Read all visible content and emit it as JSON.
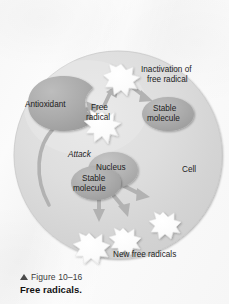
{
  "figure": {
    "caption_number": "Figure 10–16",
    "caption_title": "Free radicals.",
    "caption_marker_icon": "up-triangle-icon"
  },
  "diagram": {
    "type": "biological-process-illustration",
    "colors": {
      "cell_fill": "#d9d9d9",
      "cell_fill_light": "#e8e8e8",
      "organelle_fill": "#a8a8a8",
      "nucleus_fill": "#b4b4b4",
      "radical_fill": "#fdfdfd",
      "arrow_fill": "#b0b0b0",
      "text": "#1c1c1c",
      "background": "#f7f7f7"
    },
    "labels": {
      "cell": "Cell",
      "antioxidant": "Antioxidant",
      "free_radical_line1": "Free",
      "free_radical_line2": "radical",
      "inactivation_line1": "Inactivation of",
      "inactivation_line2": "free radical",
      "stable_molecule_top_line1": "Stable",
      "stable_molecule_top_line2": "molecule",
      "attack": "Attack",
      "nucleus": "Nucleus",
      "stable_molecule_center_line1": "Stable",
      "stable_molecule_center_line2": "molecule",
      "new_free_radicals": "New free radicals"
    },
    "elements": [
      {
        "name": "cell-body",
        "kind": "circle",
        "label": "Cell"
      },
      {
        "name": "antioxidant-blob",
        "kind": "receptor",
        "label": "Antioxidant"
      },
      {
        "name": "free-radical-burst",
        "kind": "starburst",
        "label": "Free radical"
      },
      {
        "name": "inactivated-radical-burst",
        "kind": "starburst",
        "label": "Inactivation of free radical"
      },
      {
        "name": "stable-molecule-top",
        "kind": "ellipse",
        "label": "Stable molecule"
      },
      {
        "name": "nucleus",
        "kind": "ellipse",
        "label": "Nucleus"
      },
      {
        "name": "stable-molecule-center",
        "kind": "ellipse",
        "label": "Stable molecule"
      },
      {
        "name": "new-radical-burst-left",
        "kind": "starburst",
        "label": "New free radicals"
      },
      {
        "name": "new-radical-burst-mid",
        "kind": "starburst",
        "label": "New free radicals"
      },
      {
        "name": "new-radical-burst-right",
        "kind": "starburst",
        "label": "New free radicals"
      }
    ],
    "arrows": [
      {
        "name": "arrow-radical-to-inactivation",
        "from": "free-radical-burst",
        "to": "inactivated-radical-burst"
      },
      {
        "name": "arrow-inactivation-to-stable",
        "from": "inactivated-radical-burst",
        "to": "stable-molecule-top"
      },
      {
        "name": "arrow-attack-curve",
        "from": "stable-molecule-center",
        "to": "free-radical-burst",
        "label": "Attack"
      },
      {
        "name": "arrow-new-radical-left",
        "from": "stable-molecule-center",
        "to": "new-radical-burst-left"
      },
      {
        "name": "arrow-new-radical-mid",
        "from": "stable-molecule-center",
        "to": "new-radical-burst-mid"
      },
      {
        "name": "arrow-new-radical-right",
        "from": "stable-molecule-center",
        "to": "new-radical-burst-right"
      }
    ]
  }
}
